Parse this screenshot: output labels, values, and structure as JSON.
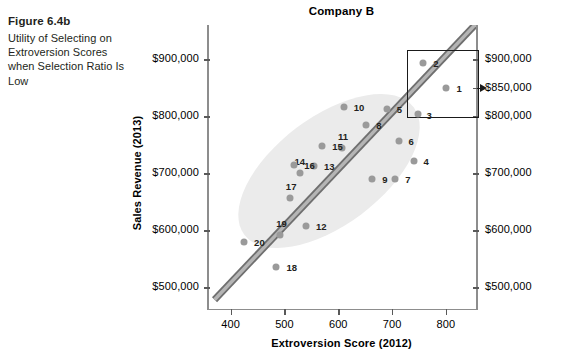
{
  "caption": {
    "figure_number": "Figure 6.4b",
    "description": "Utility of Selecting on Extroversion Scores when Selection Ratio Is Low"
  },
  "chart_data": {
    "type": "scatter",
    "title": "Company B",
    "xlabel": "Extroversion Score (2012)",
    "ylabel": "Sales Revenue (2013)",
    "xlim": [
      356,
      856
    ],
    "ylim": [
      460000,
      960000
    ],
    "xticks": [
      400,
      500,
      600,
      700,
      800
    ],
    "xticklabels": [
      "400",
      "500",
      "600",
      "700",
      "800"
    ],
    "yticks_left": [
      500000,
      600000,
      700000,
      800000,
      900000
    ],
    "yticklabels_left": [
      "$500,000",
      "$600,000",
      "$700,000",
      "$800,000",
      "$900,000"
    ],
    "yticks_right": [
      500000,
      600000,
      700000,
      800000,
      850000,
      900000
    ],
    "yticklabels_right": [
      "$500,000",
      "$600,000",
      "$700,000",
      "$800,000",
      "$850,000",
      "$900,000"
    ],
    "grid": false,
    "legend": "none",
    "points": [
      {
        "label": "1",
        "x": 801,
        "y": 850000,
        "lx": 10,
        "ly": 0
      },
      {
        "label": "2",
        "x": 758,
        "y": 894000,
        "lx": 10,
        "ly": 0
      },
      {
        "label": "3",
        "x": 749,
        "y": 804000,
        "lx": 8,
        "ly": 1
      },
      {
        "label": "4",
        "x": 740,
        "y": 722000,
        "lx": 10,
        "ly": 0
      },
      {
        "label": "5",
        "x": 690,
        "y": 812000,
        "lx": 10,
        "ly": 0
      },
      {
        "label": "6",
        "x": 712,
        "y": 756000,
        "lx": 10,
        "ly": 0
      },
      {
        "label": "7",
        "x": 706,
        "y": 690000,
        "lx": 10,
        "ly": 0
      },
      {
        "label": "8",
        "x": 652,
        "y": 785000,
        "lx": 10,
        "ly": 0
      },
      {
        "label": "9",
        "x": 663,
        "y": 690000,
        "lx": 10,
        "ly": 0
      },
      {
        "label": "10",
        "x": 610,
        "y": 816000,
        "lx": 10,
        "ly": 0
      },
      {
        "label": "11",
        "x": 607,
        "y": 744000,
        "lx": -4,
        "ly": -12
      },
      {
        "label": "12",
        "x": 540,
        "y": 607000,
        "lx": 10,
        "ly": 0
      },
      {
        "label": "13",
        "x": 555,
        "y": 712000,
        "lx": 10,
        "ly": 0
      },
      {
        "label": "14",
        "x": 528,
        "y": 700000,
        "lx": -5,
        "ly": -12
      },
      {
        "label": "15",
        "x": 570,
        "y": 748000,
        "lx": 10,
        "ly": 0
      },
      {
        "label": "16",
        "x": 518,
        "y": 715000,
        "lx": 10,
        "ly": 0
      },
      {
        "label": "17",
        "x": 510,
        "y": 657000,
        "lx": -4,
        "ly": -12
      },
      {
        "label": "18",
        "x": 485,
        "y": 535000,
        "lx": 10,
        "ly": 0
      },
      {
        "label": "19",
        "x": 492,
        "y": 592000,
        "lx": -4,
        "ly": -12
      },
      {
        "label": "20",
        "x": 425,
        "y": 580000,
        "lx": 10,
        "ly": 0
      }
    ],
    "trend_band": {
      "description": "grey diagonal regression band",
      "color": "#9a9a9a",
      "x_start": 370,
      "y_start": 478000,
      "x_end": 856,
      "y_end": 962000
    },
    "cloud_ellipse": {
      "description": "light grey data-cloud ellipse",
      "color": "#ebebeb"
    },
    "selection_box": {
      "description": "selected top performers region",
      "x_min": 728,
      "x_max": 857,
      "y_min": 800000,
      "y_max": 916000,
      "contains": [
        "1",
        "2",
        "3"
      ]
    },
    "annotation_arrow": {
      "description": "arrow from selection box to $850,000 on right axis",
      "points_to": "$850,000"
    }
  }
}
